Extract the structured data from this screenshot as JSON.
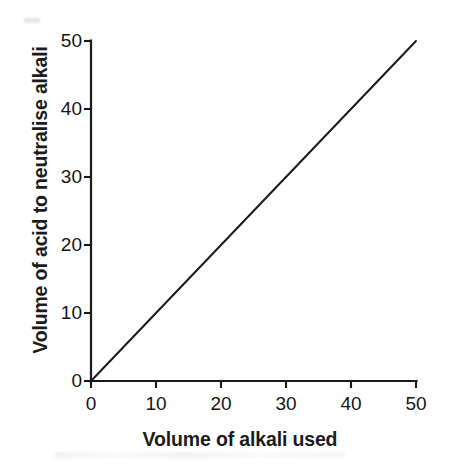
{
  "chart_data": {
    "type": "line",
    "title": "",
    "subtitle": "",
    "xlabel": "Volume of alkali used",
    "ylabel": "Volume of acid to neutralise alkali",
    "xlim": [
      0,
      50
    ],
    "ylim": [
      0,
      50
    ],
    "xticks": [
      0,
      10,
      20,
      30,
      40,
      50
    ],
    "yticks": [
      0,
      10,
      20,
      30,
      40,
      50
    ],
    "xtick_labels": [
      "0",
      "10",
      "20",
      "30",
      "40",
      "50"
    ],
    "ytick_labels": [
      "0",
      "10",
      "20",
      "30",
      "40",
      "50"
    ],
    "grid": false,
    "legend": false,
    "legend_position": "none",
    "annotations": [],
    "series": [
      {
        "name": "acid vs alkali",
        "x": [
          0,
          10,
          20,
          30,
          40,
          50
        ],
        "values": [
          0,
          10,
          20,
          30,
          40,
          50
        ],
        "color": "#1a1a1a",
        "linewidth": 2,
        "marker": "none"
      }
    ],
    "colors": {
      "line": "#1a1a1a",
      "axis": "#1a1a1a",
      "text": "#151515",
      "background": "#ffffff"
    }
  },
  "axes": {
    "x_title": "Volume of alkali used",
    "y_title": "Volume of acid to neutralise alkali",
    "x_ticks": [
      {
        "label": "0",
        "value": 0
      },
      {
        "label": "10",
        "value": 10
      },
      {
        "label": "20",
        "value": 20
      },
      {
        "label": "30",
        "value": 30
      },
      {
        "label": "40",
        "value": 40
      },
      {
        "label": "50",
        "value": 50
      }
    ],
    "y_ticks": [
      {
        "label": "0",
        "value": 0
      },
      {
        "label": "10",
        "value": 10
      },
      {
        "label": "20",
        "value": 20
      },
      {
        "label": "30",
        "value": 30
      },
      {
        "label": "40",
        "value": 40
      },
      {
        "label": "50",
        "value": 50
      }
    ]
  }
}
